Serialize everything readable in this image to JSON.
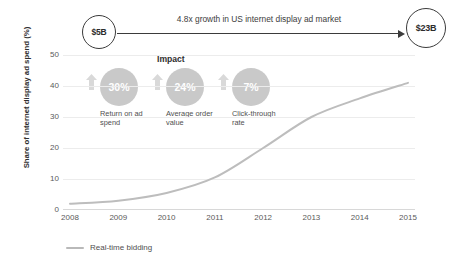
{
  "header": {
    "start_node": "$5B",
    "end_node": "$23B",
    "growth_label": "4.8x growth in US internet display ad market",
    "arrow_icon": "right-arrow-icon"
  },
  "impact": {
    "title": "Impact",
    "items": [
      {
        "value": "30%",
        "caption": "Return on ad spend",
        "icon": "up-arrow-icon"
      },
      {
        "value": "24%",
        "caption": "Average order value",
        "icon": "up-arrow-icon"
      },
      {
        "value": "7%",
        "caption": "Click-through rate",
        "icon": "up-arrow-icon"
      }
    ]
  },
  "colors": {
    "line": "#bdbdbd",
    "bubble": "#c9c9c9",
    "grid": "#ececec",
    "node_border": "#3b3b3b",
    "text": "#4a4a4a"
  },
  "chart_data": {
    "type": "line",
    "title": "",
    "xlabel": "",
    "ylabel": "Share of internet display ad spend (%)",
    "x": [
      "2008",
      "2009",
      "2010",
      "2011",
      "2012",
      "2013",
      "2014",
      "2015"
    ],
    "yticks": [
      "0",
      "10",
      "20",
      "30",
      "40",
      "50"
    ],
    "ylim": [
      0,
      50
    ],
    "grid": true,
    "legend_position": "bottom-left",
    "series": [
      {
        "name": "Real-time bidding",
        "values": [
          2,
          3,
          5.5,
          10.5,
          20,
          30,
          36,
          41
        ]
      }
    ]
  }
}
